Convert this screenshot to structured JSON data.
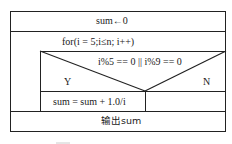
{
  "diagram": {
    "type": "nassi-shneiderman",
    "init": "sum←0",
    "loop": "for(i = 5;i≤n; i++)",
    "condition": "i%5 == 0 || i%9 == 0",
    "yes_label": "Y",
    "no_label": "N",
    "yes_action": "sum = sum + 1.0/i",
    "no_action": "",
    "output": "输出sum"
  }
}
